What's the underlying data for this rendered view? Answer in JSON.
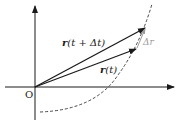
{
  "diagram": {
    "origin_label": "O",
    "vector_later_label": "r (t + Δt)",
    "vector_later_parts": {
      "r": "r",
      "rest": "(t + Δt)"
    },
    "vector_now_label": "r(t)",
    "vector_now_parts": {
      "r": "r",
      "rest": "(t)"
    },
    "delta_label": "Δr",
    "colors": {
      "axis": "#1a1a1a",
      "vector": "#1a1a1a",
      "delta": "#9a9a9a",
      "curve": "#333333"
    }
  }
}
